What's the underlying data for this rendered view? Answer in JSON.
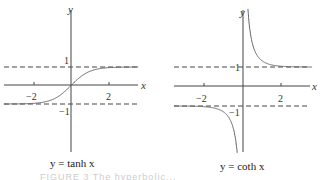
{
  "chart_data": [
    {
      "type": "line",
      "title": "",
      "caption": "y = tanh x",
      "xlabel": "x",
      "ylabel": "y",
      "x_ticks": [
        "−2",
        "2"
      ],
      "y_ticks": [
        "1",
        "−1"
      ],
      "asymptotes": [
        1,
        -1
      ],
      "xlim": [
        -3.6,
        3.6
      ],
      "ylim": [
        -3.6,
        4.4
      ],
      "series": [
        {
          "name": "tanh x",
          "function": "tanh"
        }
      ],
      "grid": false
    },
    {
      "type": "line",
      "title": "",
      "caption": "y = coth x",
      "xlabel": "x",
      "ylabel": "y",
      "x_ticks": [
        "−2",
        "2"
      ],
      "y_ticks": [
        "1",
        "−1"
      ],
      "asymptotes": [
        1,
        -1
      ],
      "xlim": [
        -3.6,
        3.6
      ],
      "ylim": [
        -3.6,
        4.4
      ],
      "series": [
        {
          "name": "coth x",
          "function": "coth"
        }
      ],
      "grid": false
    }
  ],
  "figure_caption": "FIGURE 3  The hyperbolic..."
}
